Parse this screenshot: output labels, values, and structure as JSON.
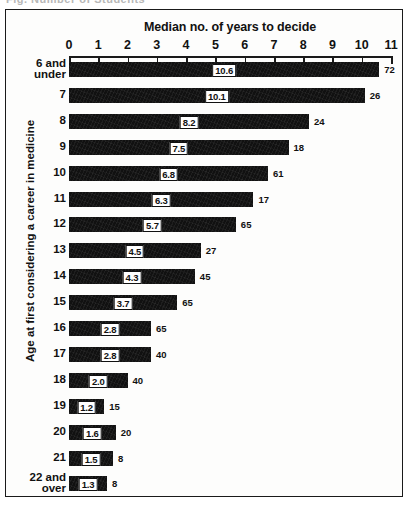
{
  "top_ghost_text": "Fig.  Number of Students",
  "chart_data": {
    "type": "bar",
    "orientation": "horizontal",
    "title": "",
    "xlabel": "Median no. of years to decide",
    "ylabel": "Age at first considering a career in medicine",
    "xlim": [
      0,
      11
    ],
    "xticks": [
      0,
      1,
      2,
      3,
      4,
      5,
      6,
      7,
      8,
      9,
      10,
      11
    ],
    "xticklabels": [
      "0",
      "1",
      "2",
      "3",
      "4",
      "5",
      "6",
      "7",
      "8",
      "9",
      "10",
      "11"
    ],
    "grid": false,
    "legend": null,
    "categories": [
      "6 and under",
      "7",
      "8",
      "9",
      "10",
      "11",
      "12",
      "13",
      "14",
      "15",
      "16",
      "17",
      "18",
      "19",
      "20",
      "21",
      "22 and over"
    ],
    "values": [
      10.6,
      10.1,
      8.2,
      7.5,
      6.8,
      6.3,
      5.7,
      4.5,
      4.3,
      3.7,
      2.8,
      2.8,
      2.0,
      1.2,
      1.6,
      1.5,
      1.3
    ],
    "value_labels": [
      "10.6",
      "10.1",
      "8.2",
      "7.5",
      "6.8",
      "6.3",
      "5.7",
      "4.5",
      "4.3",
      "3.7",
      "2.8",
      "2.8",
      "2.0",
      "1.2",
      "1.6",
      "1.5",
      "1.3"
    ],
    "counts": [
      72,
      26,
      24,
      18,
      61,
      17,
      65,
      27,
      45,
      65,
      65,
      40,
      40,
      15,
      20,
      8,
      8
    ],
    "count_labels": [
      "72",
      "26",
      "24",
      "18",
      "61",
      "17",
      "65",
      "27",
      "45",
      "65",
      "65",
      "40",
      "40",
      "15",
      "20",
      "8",
      "8"
    ],
    "bar_color": "#111111",
    "value_label_style": "white box with black border, centered in bar",
    "count_label_position": "right of bar end"
  },
  "rows": [
    {
      "label_line1": "6 and",
      "label_line2": "under",
      "value": "10.6",
      "count": "72"
    },
    {
      "label_line1": "7",
      "label_line2": "",
      "value": "10.1",
      "count": "26"
    },
    {
      "label_line1": "8",
      "label_line2": "",
      "value": "8.2",
      "count": "24"
    },
    {
      "label_line1": "9",
      "label_line2": "",
      "value": "7.5",
      "count": "18"
    },
    {
      "label_line1": "10",
      "label_line2": "",
      "value": "6.8",
      "count": "61"
    },
    {
      "label_line1": "11",
      "label_line2": "",
      "value": "6.3",
      "count": "17"
    },
    {
      "label_line1": "12",
      "label_line2": "",
      "value": "5.7",
      "count": "65"
    },
    {
      "label_line1": "13",
      "label_line2": "",
      "value": "4.5",
      "count": "27"
    },
    {
      "label_line1": "14",
      "label_line2": "",
      "value": "4.3",
      "count": "45"
    },
    {
      "label_line1": "15",
      "label_line2": "",
      "value": "3.7",
      "count": "65"
    },
    {
      "label_line1": "16",
      "label_line2": "",
      "value": "2.8",
      "count": "65"
    },
    {
      "label_line1": "17",
      "label_line2": "",
      "value": "2.8",
      "count": "40"
    },
    {
      "label_line1": "18",
      "label_line2": "",
      "value": "2.0",
      "count": "40"
    },
    {
      "label_line1": "19",
      "label_line2": "",
      "value": "1.2",
      "count": "15"
    },
    {
      "label_line1": "20",
      "label_line2": "",
      "value": "1.6",
      "count": "20"
    },
    {
      "label_line1": "21",
      "label_line2": "",
      "value": "1.5",
      "count": "8"
    },
    {
      "label_line1": "22 and",
      "label_line2": "over",
      "value": "1.3",
      "count": "8"
    }
  ]
}
